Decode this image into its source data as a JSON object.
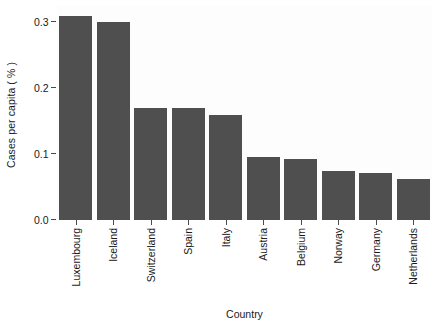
{
  "chart_data": {
    "type": "bar",
    "title": "",
    "subtitle": "",
    "xlabel": "Country",
    "ylabel": "Cases per capita ( % )",
    "categories": [
      "Luxembourg",
      "Iceland",
      "Switzerland",
      "Spain",
      "Italy",
      "Austria",
      "Belgium",
      "Norway",
      "Germany",
      "Netherlands"
    ],
    "values": [
      0.31,
      0.3,
      0.17,
      0.17,
      0.16,
      0.095,
      0.092,
      0.075,
      0.072,
      0.062
    ],
    "ylim": [
      0.0,
      0.325
    ],
    "yticks": [
      0.0,
      0.1,
      0.2,
      0.3
    ],
    "ytick_labels": [
      "0.0",
      "0.1",
      "0.2",
      "0.3"
    ],
    "grid": false,
    "legend": "none",
    "bar_color": "#4f4f4f",
    "panel_color": "#fdfdfd",
    "axis_color": "#4a4a4a",
    "text_color": "#1a1a1a"
  }
}
